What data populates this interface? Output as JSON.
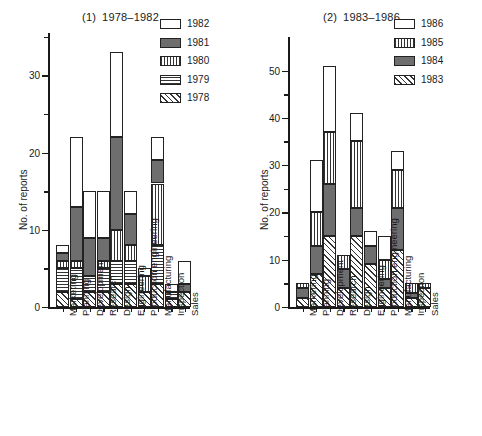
{
  "figure": {
    "y_axis_title": "No. of reports"
  },
  "chart_data": [
    {
      "type": "bar",
      "stacked": true,
      "panel_number": "(1)",
      "title": "1978–1982",
      "xlabel": "",
      "ylabel": "No. of reports",
      "ylim": [
        0,
        36
      ],
      "yticks": [
        0,
        10,
        20,
        30
      ],
      "grid": false,
      "legend_position": "top-right",
      "categories": [
        "Marketing",
        "Planning",
        "Development",
        "Research",
        "Design",
        "Engineering",
        "Production engineering",
        "Manufacturing",
        "Inspection",
        "Sales"
      ],
      "series": [
        {
          "name": "1978",
          "pattern": "diagonal-hatch",
          "color": "#ffffff",
          "values": [
            2,
            1,
            2,
            2,
            3,
            3,
            2,
            3,
            1,
            2
          ]
        },
        {
          "name": "1979",
          "pattern": "horizontal-lines",
          "color": "#ffffff",
          "values": [
            3,
            4,
            2,
            3,
            3,
            3,
            0,
            5,
            1,
            0
          ]
        },
        {
          "name": "1980",
          "pattern": "vertical-lines",
          "color": "#ffffff",
          "values": [
            1,
            1,
            0,
            1,
            4,
            2,
            2,
            8,
            0,
            0
          ]
        },
        {
          "name": "1981",
          "pattern": "solid-dark",
          "color": "#6e6e6e",
          "values": [
            1,
            7,
            5,
            3,
            12,
            4,
            0,
            3,
            0,
            1
          ]
        },
        {
          "name": "1982",
          "pattern": "white",
          "color": "#ffffff",
          "values": [
            1,
            9,
            6,
            6,
            11,
            3,
            1,
            3,
            1,
            3
          ]
        }
      ],
      "totals": [
        8,
        22,
        15,
        15,
        33,
        15,
        5,
        22,
        3,
        6
      ]
    },
    {
      "type": "bar",
      "stacked": true,
      "panel_number": "(2)",
      "title": "1983–1986",
      "xlabel": "",
      "ylabel": "No. of reports",
      "ylim": [
        0,
        55
      ],
      "yticks": [
        0,
        10,
        20,
        30,
        40,
        50
      ],
      "grid": false,
      "legend_position": "top-right",
      "categories": [
        "Marketing",
        "Planning",
        "Development",
        "Research",
        "Design",
        "Engineering",
        "Production engineering",
        "Manufacturing",
        "Inspection",
        "Sales"
      ],
      "series": [
        {
          "name": "1983",
          "pattern": "diagonal-hatch",
          "color": "#ffffff",
          "values": [
            2,
            7,
            15,
            4,
            15,
            9,
            4,
            12,
            2,
            4
          ]
        },
        {
          "name": "1984",
          "pattern": "solid-dark",
          "color": "#6e6e6e",
          "values": [
            2,
            6,
            11,
            4,
            6,
            4,
            2,
            9,
            1,
            0
          ]
        },
        {
          "name": "1985",
          "pattern": "vertical-lines",
          "color": "#ffffff",
          "values": [
            1,
            7,
            11,
            3,
            14,
            0,
            4,
            8,
            2,
            1
          ]
        },
        {
          "name": "1986",
          "pattern": "white",
          "color": "#ffffff",
          "values": [
            0,
            11,
            14,
            0,
            6,
            3,
            5,
            4,
            0,
            0
          ]
        }
      ],
      "totals": [
        5,
        31,
        51,
        11,
        41,
        16,
        15,
        33,
        5,
        5
      ]
    }
  ],
  "legends": [
    {
      "panel": 1,
      "entries": [
        {
          "label": "1982",
          "pattern": "white"
        },
        {
          "label": "1981",
          "pattern": "solid-dark"
        },
        {
          "label": "1980",
          "pattern": "vertical-lines"
        },
        {
          "label": "1979",
          "pattern": "horizontal-lines"
        },
        {
          "label": "1978",
          "pattern": "diagonal-hatch"
        }
      ]
    },
    {
      "panel": 2,
      "entries": [
        {
          "label": "1986",
          "pattern": "white"
        },
        {
          "label": "1985",
          "pattern": "vertical-lines"
        },
        {
          "label": "1984",
          "pattern": "solid-dark"
        },
        {
          "label": "1983",
          "pattern": "diagonal-hatch"
        }
      ]
    }
  ]
}
